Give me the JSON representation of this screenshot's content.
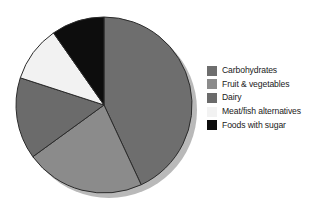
{
  "chart_data": {
    "type": "pie",
    "title": "",
    "subtitle": "",
    "xlabel": "",
    "ylabel": "",
    "grid": false,
    "legend_position": "right",
    "start_angle_deg": 0,
    "direction": "clockwise",
    "center": {
      "x": 104,
      "y": 105
    },
    "radius": 88,
    "categories": [
      "Carbohydrates",
      "Fruit & vegetables",
      "Dairy",
      "Meat/fish alternatives",
      "Foods with sugar"
    ],
    "values": [
      43,
      22,
      15,
      10,
      10
    ],
    "slices": [
      {
        "label": "Carbohydrates",
        "value": 43,
        "color": "#6e6e6e",
        "start_deg": 0,
        "end_deg": 155,
        "sweep_deg": 155
      },
      {
        "label": "Fruit & vegetables",
        "value": 22,
        "color": "#8b8b8b",
        "start_deg": 155,
        "end_deg": 234,
        "sweep_deg": 79
      },
      {
        "label": "Dairy",
        "value": 15,
        "color": "#6b6b6b",
        "start_deg": 234,
        "end_deg": 288,
        "sweep_deg": 54
      },
      {
        "label": "Meat/fish alternatives",
        "value": 10,
        "color": "#f2f2f2",
        "start_deg": 288,
        "end_deg": 325,
        "sweep_deg": 37
      },
      {
        "label": "Foods with sugar",
        "value": 10,
        "color": "#0d0d0d",
        "start_deg": 325,
        "end_deg": 360,
        "sweep_deg": 35
      }
    ]
  },
  "legend": {
    "items": [
      {
        "label": "Carbohydrates",
        "swatch_color": "#6e6e6e"
      },
      {
        "label": "Fruit & vegetables",
        "swatch_color": "#8b8b8b"
      },
      {
        "label": "Dairy",
        "swatch_color": "#6b6b6b"
      },
      {
        "label": "Meat/fish alternatives",
        "swatch_color": "#f2f2f2"
      },
      {
        "label": "Foods with sugar",
        "swatch_color": "#0d0d0d"
      }
    ]
  },
  "style": {
    "background": "#ffffff",
    "slice_outline": "#2b2b2b",
    "pie_shadow": "#b9b9b9",
    "text_color": "#1a1a1a"
  }
}
